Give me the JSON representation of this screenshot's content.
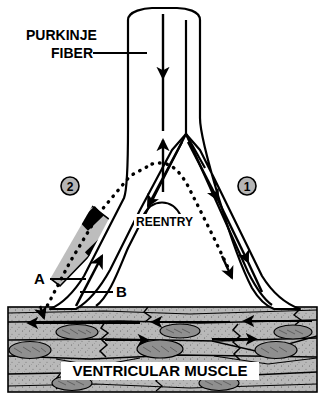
{
  "figure": {
    "background_color": "#ffffff",
    "line_color": "#000000",
    "muscle_fill": "#b9b9b9",
    "block_fill": "#000000",
    "depressed_segment_fill": "#bdbdbd",
    "badge_fill": "#b5b5b5"
  },
  "labels": {
    "purkinje_line1": "PURKINJE",
    "purkinje_line2": "FIBER",
    "reentry": "REENTRY",
    "ventricular_muscle": "VENTRICULAR MUSCLE",
    "point_a": "A",
    "point_b": "B",
    "badge_one": "1",
    "badge_two": "2"
  },
  "annotations": {
    "pathway_one_description": "Normal antegrade conduction down right branch",
    "pathway_two_description": "Depressed segment with unidirectional block on left branch",
    "reentry_description": "Retrograde impulse reenters branch point"
  }
}
